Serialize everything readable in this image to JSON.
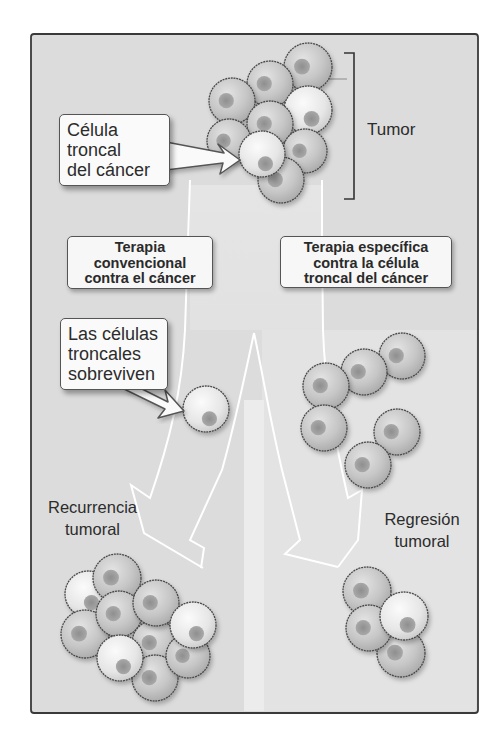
{
  "figure": {
    "tumor_label": "Tumor",
    "stem_cell_callout": [
      "Célula",
      "troncal",
      "del cáncer"
    ],
    "conventional_therapy": [
      "Terapia",
      "convencional",
      "contra el cáncer"
    ],
    "targeted_therapy": [
      "Terapia específica",
      "contra la célula",
      "troncal del cáncer"
    ],
    "survivor_callout": [
      "Las células",
      "troncales",
      "sobreviven"
    ],
    "recurrence_label": [
      "Recurrencia",
      "tumoral"
    ],
    "regression_label": [
      "Regresión",
      "tumoral"
    ]
  },
  "colors": {
    "frame_bg": "#dcdcdc",
    "frame_border": "#3a3a3a",
    "cell_fill": "#c4c4c4",
    "cell_fill_light": "#e6e6e6",
    "nucleus": "#9a9a9a",
    "arrow_outline": "#ffffff"
  },
  "cells": {
    "tumor": [
      {
        "x": 308,
        "y": 67,
        "r": 24,
        "type": "normal"
      },
      {
        "x": 270,
        "y": 84,
        "r": 23,
        "type": "normal"
      },
      {
        "x": 232,
        "y": 101,
        "r": 23,
        "type": "normal"
      },
      {
        "x": 308,
        "y": 110,
        "r": 24,
        "type": "light"
      },
      {
        "x": 270,
        "y": 124,
        "r": 23,
        "type": "normal"
      },
      {
        "x": 229,
        "y": 141,
        "r": 22,
        "type": "normal"
      },
      {
        "x": 305,
        "y": 151,
        "r": 22,
        "type": "normal"
      },
      {
        "x": 281,
        "y": 180,
        "r": 23,
        "type": "normal"
      },
      {
        "x": 262,
        "y": 154,
        "r": 23,
        "type": "stem"
      }
    ],
    "survivor": [
      {
        "x": 206,
        "y": 409,
        "r": 23,
        "type": "stem"
      }
    ],
    "targeted_result": [
      {
        "x": 402,
        "y": 356,
        "r": 23,
        "type": "normal"
      },
      {
        "x": 364,
        "y": 372,
        "r": 23,
        "type": "normal"
      },
      {
        "x": 326,
        "y": 386,
        "r": 23,
        "type": "normal"
      },
      {
        "x": 324,
        "y": 428,
        "r": 23,
        "type": "normal"
      },
      {
        "x": 397,
        "y": 432,
        "r": 23,
        "type": "normal"
      },
      {
        "x": 368,
        "y": 465,
        "r": 23,
        "type": "normal"
      }
    ],
    "recurrence": [
      {
        "x": 88,
        "y": 594,
        "r": 23,
        "type": "light"
      },
      {
        "x": 85,
        "y": 634,
        "r": 24,
        "type": "normal"
      },
      {
        "x": 117,
        "y": 578,
        "r": 24,
        "type": "normal"
      },
      {
        "x": 119,
        "y": 614,
        "r": 23,
        "type": "normal"
      },
      {
        "x": 155,
        "y": 643,
        "r": 23,
        "type": "normal"
      },
      {
        "x": 156,
        "y": 603,
        "r": 23,
        "type": "normal"
      },
      {
        "x": 155,
        "y": 678,
        "r": 23,
        "type": "normal"
      },
      {
        "x": 188,
        "y": 656,
        "r": 22,
        "type": "normal"
      },
      {
        "x": 193,
        "y": 625,
        "r": 23,
        "type": "light"
      },
      {
        "x": 120,
        "y": 658,
        "r": 23,
        "type": "light"
      }
    ],
    "regression": [
      {
        "x": 367,
        "y": 591,
        "r": 24,
        "type": "normal"
      },
      {
        "x": 401,
        "y": 653,
        "r": 24,
        "type": "normal"
      },
      {
        "x": 369,
        "y": 628,
        "r": 23,
        "type": "normal"
      },
      {
        "x": 404,
        "y": 616,
        "r": 24,
        "type": "light"
      }
    ]
  }
}
